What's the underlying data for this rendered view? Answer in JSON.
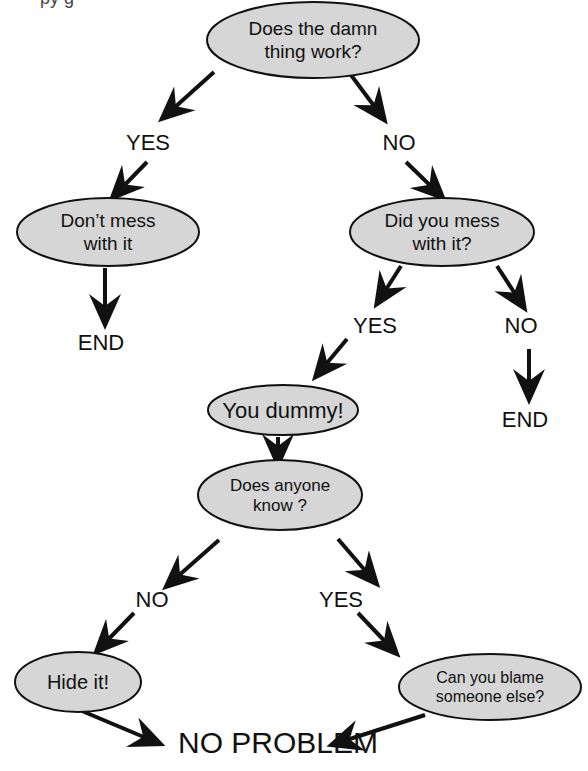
{
  "page": {
    "cut_off_fragment": "py g"
  },
  "colors": {
    "node_fill": "#d6d6d6",
    "node_stroke": "#111111",
    "arrow": "#111111",
    "background": "#ffffff"
  },
  "nodes": [
    {
      "id": "works",
      "lines": [
        "Does the damn",
        "thing work?"
      ],
      "cx": 313,
      "cy": 40,
      "rx": 106,
      "ry": 38,
      "font": 19
    },
    {
      "id": "dont-mess",
      "lines": [
        "Don’t mess",
        "with it"
      ],
      "cx": 108,
      "cy": 232,
      "rx": 91,
      "ry": 34,
      "font": 19
    },
    {
      "id": "did-you-mess",
      "lines": [
        "Did you mess",
        "with it?"
      ],
      "cx": 442,
      "cy": 232,
      "rx": 92,
      "ry": 34,
      "font": 19
    },
    {
      "id": "you-dummy",
      "lines": [
        "You dummy!"
      ],
      "cx": 283,
      "cy": 410,
      "rx": 75,
      "ry": 25,
      "font": 22
    },
    {
      "id": "anyone-know",
      "lines": [
        "Does anyone",
        "know ?"
      ],
      "cx": 280,
      "cy": 495,
      "rx": 82,
      "ry": 35,
      "font": 17
    },
    {
      "id": "hide-it",
      "lines": [
        "Hide it!"
      ],
      "cx": 78,
      "cy": 682,
      "rx": 63,
      "ry": 30,
      "font": 20
    },
    {
      "id": "blame",
      "lines": [
        "Can you blame",
        "someone else?"
      ],
      "cx": 490,
      "cy": 687,
      "rx": 91,
      "ry": 33,
      "font": 16
    }
  ],
  "labels": [
    {
      "id": "yes-1",
      "text": "YES",
      "x": 148,
      "y": 150,
      "font": 22
    },
    {
      "id": "no-1",
      "text": "NO",
      "x": 399,
      "y": 150,
      "font": 22
    },
    {
      "id": "end-1",
      "text": "END",
      "x": 101,
      "y": 350,
      "font": 22
    },
    {
      "id": "yes-2",
      "text": "YES",
      "x": 375,
      "y": 333,
      "font": 22
    },
    {
      "id": "no-2",
      "text": "NO",
      "x": 521,
      "y": 333,
      "font": 22
    },
    {
      "id": "end-2",
      "text": "END",
      "x": 525,
      "y": 427,
      "font": 22
    },
    {
      "id": "no-3",
      "text": "NO",
      "x": 152,
      "y": 607,
      "font": 22
    },
    {
      "id": "yes-3",
      "text": "YES",
      "x": 341,
      "y": 607,
      "font": 22
    },
    {
      "id": "no-problem",
      "text": "NO PROBLEM",
      "x": 278,
      "y": 753,
      "font": 30
    }
  ],
  "arrows": [
    {
      "from": "works",
      "to": "yes-1",
      "x1": 214,
      "y1": 72,
      "x2": 164,
      "y2": 117
    },
    {
      "from": "works",
      "to": "no-1",
      "x1": 351,
      "y1": 75,
      "x2": 383,
      "y2": 118
    },
    {
      "from": "yes-1",
      "to": "dont-mess",
      "x1": 147,
      "y1": 162,
      "x2": 114,
      "y2": 196
    },
    {
      "from": "no-1",
      "to": "did-you-mess",
      "x1": 406,
      "y1": 162,
      "x2": 441,
      "y2": 196
    },
    {
      "from": "dont-mess",
      "to": "end-1",
      "x1": 105,
      "y1": 268,
      "x2": 105,
      "y2": 322
    },
    {
      "from": "did-you-mess",
      "to": "yes-2",
      "x1": 401,
      "y1": 266,
      "x2": 378,
      "y2": 302
    },
    {
      "from": "did-you-mess",
      "to": "no-2",
      "x1": 497,
      "y1": 266,
      "x2": 523,
      "y2": 306
    },
    {
      "from": "no-2",
      "to": "end-2",
      "x1": 529,
      "y1": 349,
      "x2": 529,
      "y2": 397
    },
    {
      "from": "yes-2",
      "to": "you-dummy",
      "x1": 347,
      "y1": 339,
      "x2": 317,
      "y2": 375
    },
    {
      "from": "you-dummy",
      "to": "anyone-know",
      "x1": 278,
      "y1": 437,
      "x2": 278,
      "y2": 462
    },
    {
      "from": "anyone-know",
      "to": "no-3",
      "x1": 219,
      "y1": 540,
      "x2": 168,
      "y2": 585
    },
    {
      "from": "anyone-know",
      "to": "yes-3",
      "x1": 338,
      "y1": 539,
      "x2": 375,
      "y2": 582
    },
    {
      "from": "no-3",
      "to": "hide-it",
      "x1": 134,
      "y1": 613,
      "x2": 98,
      "y2": 650
    },
    {
      "from": "yes-3",
      "to": "blame",
      "x1": 358,
      "y1": 613,
      "x2": 395,
      "y2": 652
    },
    {
      "from": "hide-it",
      "to": "no-problem",
      "x1": 82,
      "y1": 711,
      "x2": 158,
      "y2": 743
    },
    {
      "from": "blame",
      "to": "no-problem",
      "x1": 425,
      "y1": 715,
      "x2": 334,
      "y2": 744
    }
  ]
}
